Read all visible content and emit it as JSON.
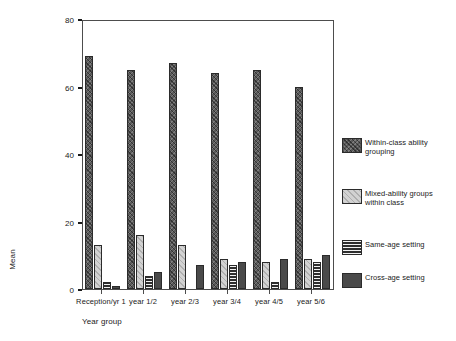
{
  "chart_data": {
    "type": "bar",
    "title": "",
    "subtitle": "",
    "xlabel": "Year group",
    "ylabel": "Mean",
    "ylim": [
      0,
      80
    ],
    "yticks": [
      0,
      20,
      40,
      60,
      80
    ],
    "ytick_labels": [
      "0",
      "20",
      "40",
      "60",
      "80"
    ],
    "grid": false,
    "legend_position": "right",
    "orientation": "vertical",
    "categories": [
      "Reception/yr 1",
      "year 1/2",
      "year 2/3",
      "year 3/4",
      "year 4/5",
      "year 5/6"
    ],
    "series": [
      {
        "name": "Within-class ability grouping",
        "pattern": "dark-crosshatch",
        "color": "#5a5a5a",
        "values": [
          69,
          65,
          67,
          64,
          65,
          60
        ]
      },
      {
        "name": "Mixed-ability groups within class",
        "pattern": "light-diagonal-hatch",
        "color": "#d2d2d2",
        "values": [
          13,
          16,
          13,
          9,
          8,
          9
        ]
      },
      {
        "name": "Same-age setting",
        "pattern": "horizontal-lines",
        "color": "#2e2e2e",
        "values": [
          2,
          4,
          0,
          7,
          2,
          8
        ]
      },
      {
        "name": "Cross-age setting",
        "pattern": "solid-dark",
        "color": "#4a4a4a",
        "values": [
          1,
          5,
          7,
          8,
          9,
          10
        ]
      }
    ]
  },
  "legend": {
    "entries": [
      "Within-class ability grouping",
      "Mixed-ability groups within class",
      "Same-age setting",
      "Cross-age setting"
    ]
  }
}
